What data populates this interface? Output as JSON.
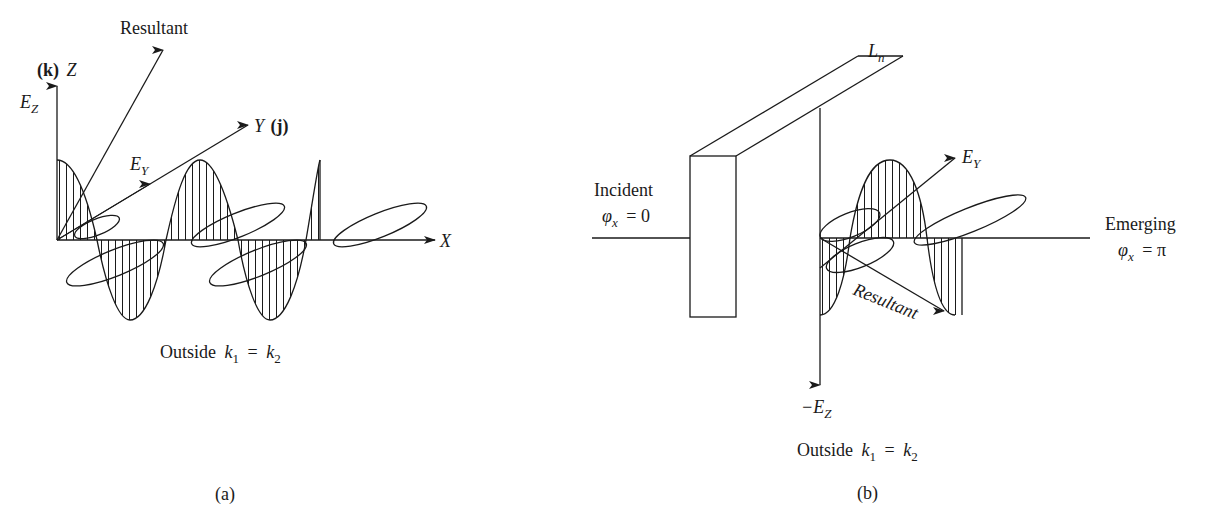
{
  "figure": {
    "panel_a": {
      "caption": "(a)",
      "subtitle_word": "Outside",
      "subtitle_k1": "k",
      "subtitle_k1_sub": "1",
      "subtitle_eq": "=",
      "subtitle_k2": "k",
      "subtitle_k2_sub": "2",
      "resultant_label": "Resultant",
      "z_axis_bold": "(k)",
      "z_axis_label": "Z",
      "ez_label": "E",
      "ez_sub": "Z",
      "ey_label": "E",
      "ey_sub": "Y",
      "y_axis_label": "Y",
      "y_axis_bold": "(j)",
      "x_axis_label": "X"
    },
    "panel_b": {
      "caption": "(b)",
      "subtitle_word": "Outside",
      "subtitle_k1": "k",
      "subtitle_k1_sub": "1",
      "subtitle_eq": "=",
      "subtitle_k2": "k",
      "subtitle_k2_sub": "2",
      "ln_label": "L",
      "ln_sub": "n",
      "incident_label": "Incident",
      "incident_phi": "φ",
      "incident_phi_sub": "x",
      "incident_phi_value": "= 0",
      "emerging_label": "Emerging",
      "emerging_phi": "φ",
      "emerging_phi_sub": "x",
      "emerging_phi_value": "= π",
      "ey_label": "E",
      "ey_sub": "Y",
      "resultant_label": "Resultant",
      "neg_ez_label": "−E",
      "neg_ez_sub": "Z"
    },
    "colors": {
      "ink": "#1a1a1a",
      "background": "#ffffff"
    }
  }
}
